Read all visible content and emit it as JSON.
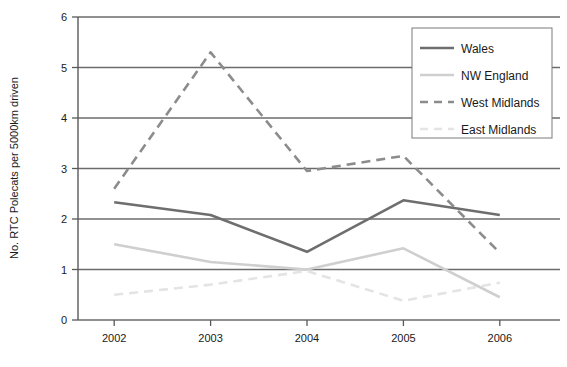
{
  "chart_data": {
    "type": "line",
    "title": "",
    "xlabel": "",
    "ylabel": "No. RTC Polecats per 5000km driven",
    "categories": [
      "2002",
      "2003",
      "2004",
      "2005",
      "2006"
    ],
    "x": [
      2002,
      2003,
      2004,
      2005,
      2006
    ],
    "ylim": [
      0,
      6
    ],
    "yticks": [
      "0",
      "1",
      "2",
      "3",
      "4",
      "5",
      "6"
    ],
    "ytick_values": [
      0,
      1,
      2,
      3,
      4,
      5,
      6
    ],
    "grid": "horizontal",
    "legend_position": "top-right",
    "series": [
      {
        "name": "Wales",
        "values": [
          2.33,
          2.08,
          1.35,
          2.37,
          2.08
        ],
        "color": "#6e6e6e",
        "style": "solid",
        "width": 2.6
      },
      {
        "name": "NW England",
        "values": [
          1.5,
          1.15,
          1.0,
          1.42,
          0.45
        ],
        "color": "#cfcfcf",
        "style": "solid",
        "width": 2.6
      },
      {
        "name": "West Midlands",
        "values": [
          2.6,
          5.3,
          2.95,
          3.25,
          1.33
        ],
        "color": "#8c8c8c",
        "style": "dashed",
        "width": 2.6
      },
      {
        "name": "East Midlands",
        "values": [
          0.5,
          0.7,
          0.97,
          0.38,
          0.74
        ],
        "color": "#e4e4e4",
        "style": "dashed",
        "width": 2.6
      }
    ],
    "axis_color": "#595959",
    "grid_color": "#6b6b6b",
    "text_color": "#1a1a1a",
    "background": "#ffffff"
  }
}
